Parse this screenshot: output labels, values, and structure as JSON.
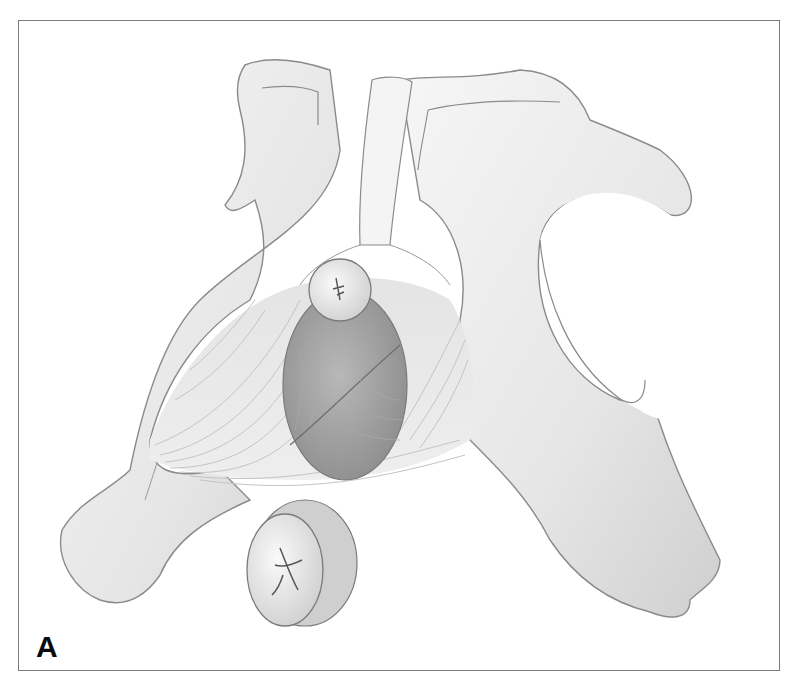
{
  "figure": {
    "panel_label": "A",
    "colors": {
      "frame": "#7a7a7a",
      "bone_light": "#f2f2f2",
      "bone_shade": "#c8c8c8",
      "outline": "#8a8a8a",
      "muscle_dark": "#9a9a9a",
      "label": "#0a0a0a"
    }
  }
}
